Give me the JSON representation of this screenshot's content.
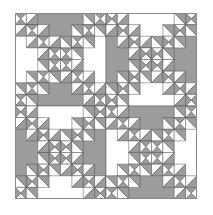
{
  "title": "Quilt block pattern",
  "colors": {
    "gray": "#9c9c9c",
    "white": "#ffffff",
    "line": "#555555",
    "border": "#8a8a8a"
  },
  "layout": {
    "rows": 2,
    "cols": 2,
    "grid": 8,
    "blocks": [
      {
        "row": 0,
        "col": 0,
        "large_gray": "top-bottom"
      },
      {
        "row": 0,
        "col": 1,
        "large_gray": "left-right"
      },
      {
        "row": 1,
        "col": 0,
        "large_gray": "left-right"
      },
      {
        "row": 1,
        "col": 1,
        "large_gray": "top-bottom"
      }
    ]
  }
}
